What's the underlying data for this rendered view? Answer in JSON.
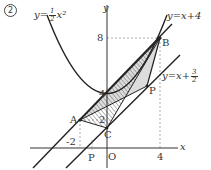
{
  "figure": {
    "problem_number": "2",
    "axes": {
      "x_label": "x",
      "y_label": "y",
      "origin_label": "O",
      "x_ticks": [
        "-2",
        "4"
      ],
      "y_ticks": [
        "8",
        "4",
        "2"
      ]
    },
    "curves": {
      "parabola_label_prefix": "y=",
      "parabola_coef_num": "1",
      "parabola_coef_den": "2",
      "parabola_label_suffix": "x²",
      "line1_label": "y=x+4",
      "line2_label_prefix": "y=x+",
      "line2_const_num": "3",
      "line2_const_den": "2"
    },
    "points": {
      "A": "A",
      "B": "B",
      "C": "C",
      "P_upper": "P",
      "P_lower": "P"
    },
    "colors": {
      "stroke": "#222222",
      "shade": "#d9d9d9",
      "hatch": "#555555",
      "dashed": "#888888"
    }
  }
}
